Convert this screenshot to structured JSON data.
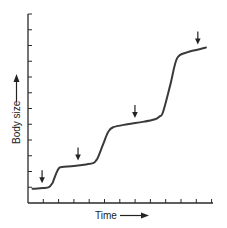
{
  "chart_data": {
    "type": "line",
    "title": "",
    "xlabel": "Time",
    "ylabel": "Body size",
    "x_tick_count": 12,
    "y_tick_count": 12,
    "x_tick_labels": [],
    "y_tick_labels": [],
    "xlim": [
      0,
      12.3
    ],
    "ylim": [
      0,
      12
    ],
    "grid": false,
    "legend": null,
    "series": [
      {
        "name": "Body size",
        "points": [
          [
            0.3,
            0.9
          ],
          [
            1.0,
            0.95
          ],
          [
            1.37,
            1.01
          ],
          [
            1.55,
            1.2
          ],
          [
            1.63,
            1.33
          ],
          [
            1.85,
            1.9
          ],
          [
            2.03,
            2.22
          ],
          [
            2.22,
            2.28
          ],
          [
            3.0,
            2.35
          ],
          [
            3.8,
            2.45
          ],
          [
            4.25,
            2.53
          ],
          [
            4.45,
            2.7
          ],
          [
            4.58,
            2.91
          ],
          [
            4.9,
            3.7
          ],
          [
            5.23,
            4.49
          ],
          [
            5.56,
            4.81
          ],
          [
            6.5,
            5.0
          ],
          [
            7.5,
            5.15
          ],
          [
            8.3,
            5.32
          ],
          [
            8.6,
            5.5
          ],
          [
            8.82,
            5.76
          ],
          [
            9.3,
            7.5
          ],
          [
            9.74,
            9.18
          ],
          [
            10.39,
            9.56
          ],
          [
            11.0,
            9.72
          ],
          [
            11.63,
            9.87
          ]
        ]
      }
    ],
    "annotations": [
      {
        "type": "down-arrow",
        "x": 0.92,
        "meaning": "molt"
      },
      {
        "type": "down-arrow",
        "x": 3.27,
        "meaning": "molt"
      },
      {
        "type": "down-arrow",
        "x": 6.99,
        "meaning": "molt"
      },
      {
        "type": "down-arrow",
        "x": 11.1,
        "meaning": "molt"
      }
    ]
  }
}
